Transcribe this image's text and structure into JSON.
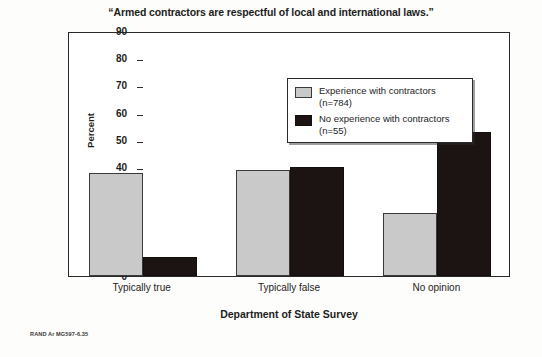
{
  "chart_data": {
    "type": "bar",
    "title": "“Armed contractors are respectful of local and international laws.”",
    "xlabel": "Department of State Survey",
    "ylabel": "Percent",
    "categories": [
      "Typically true",
      "Typically false",
      "No opinion"
    ],
    "series": [
      {
        "name": "Experience with contractors (n=784)",
        "color": "#c9c9c9",
        "values": [
          38,
          39,
          23
        ]
      },
      {
        "name": "No experience with contractors (n=55)",
        "color": "#1c1412",
        "values": [
          7,
          40,
          53
        ]
      }
    ],
    "ylim": [
      0,
      90
    ],
    "yticks": [
      0,
      10,
      20,
      30,
      40,
      50,
      60,
      70,
      80,
      90
    ],
    "ytick_labels": [
      "0",
      "10",
      "20",
      "30",
      "40",
      "50",
      "60",
      "70",
      "80",
      "90"
    ],
    "grid": false,
    "legend_position": "top-center",
    "legend": [
      {
        "label_line1": "Experience with",
        "label_line2": "contractors (n=784)",
        "swatch": "gray-swatch-icon"
      },
      {
        "label_line1": "No experience with",
        "label_line2": "contractors (n=55)",
        "swatch": "black-swatch-icon"
      }
    ]
  },
  "credit": "RAND Ar MG597-6.35"
}
